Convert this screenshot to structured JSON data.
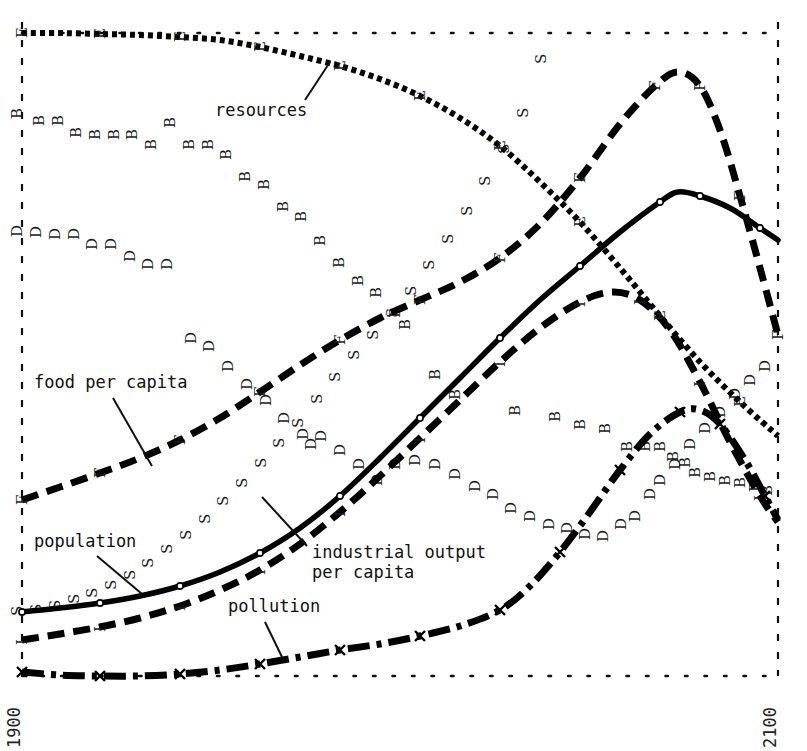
{
  "figure": {
    "background": "#ffffff",
    "ink": "#000000",
    "x_axis": {
      "left_tick_label": "1900",
      "right_tick_label": "2100",
      "orientation": "vertical-rotated"
    },
    "annotations": [
      {
        "name": "resources",
        "text": "resources",
        "x": 215,
        "y": 116,
        "leader": [
          [
            305,
            100
          ],
          [
            330,
            62
          ]
        ]
      },
      {
        "name": "food-per-capita",
        "text": "food per capita",
        "x": 34,
        "y": 388,
        "leader": [
          [
            113,
            398
          ],
          [
            152,
            466
          ]
        ]
      },
      {
        "name": "population",
        "text": "population",
        "x": 34,
        "y": 547,
        "leader": [
          [
            97,
            556
          ],
          [
            142,
            594
          ]
        ]
      },
      {
        "name": "industrial-output-per-capita",
        "text_line1": "industrial output",
        "text_line2": "per capita",
        "x": 312,
        "y": 556,
        "leader": [
          [
            307,
            546
          ],
          [
            262,
            497
          ]
        ]
      },
      {
        "name": "pollution",
        "text": "pollution",
        "x": 228,
        "y": 612,
        "leader": [
          [
            265,
            622
          ],
          [
            282,
            655
          ]
        ]
      }
    ]
  },
  "chart_data": {
    "type": "line",
    "title": "",
    "subtitle": "",
    "xlabel": "",
    "ylabel": "",
    "xlim": [
      1900,
      2100
    ],
    "grid": false,
    "legend": "inline-annotations",
    "xticks": [
      1900,
      2100
    ],
    "xticklabels": [
      "1900",
      "2100"
    ],
    "series": [
      {
        "name": "resources",
        "marker": "E",
        "style": "dotted",
        "points_px": [
          [
            22,
            33
          ],
          [
            60,
            33
          ],
          [
            100,
            34
          ],
          [
            140,
            35
          ],
          [
            180,
            37
          ],
          [
            220,
            40
          ],
          [
            260,
            47
          ],
          [
            300,
            56
          ],
          [
            340,
            66
          ],
          [
            380,
            79
          ],
          [
            420,
            96
          ],
          [
            460,
            118
          ],
          [
            500,
            146
          ],
          [
            540,
            182
          ],
          [
            580,
            222
          ],
          [
            620,
            268
          ],
          [
            660,
            316
          ],
          [
            700,
            362
          ],
          [
            740,
            402
          ],
          [
            778,
            436
          ]
        ],
        "x_years": [
          1900,
          1910,
          1920,
          1930,
          1940,
          1950,
          1960,
          1970,
          1980,
          1990,
          2000,
          2010,
          2020,
          2030,
          2040,
          2050,
          2060,
          2070,
          2080,
          2100
        ],
        "values_rel": [
          1.0,
          1.0,
          0.99,
          0.99,
          0.98,
          0.97,
          0.95,
          0.93,
          0.9,
          0.88,
          0.85,
          0.81,
          0.76,
          0.7,
          0.64,
          0.57,
          0.49,
          0.42,
          0.35,
          0.3
        ]
      },
      {
        "name": "food per capita",
        "marker": "F",
        "style": "dashed",
        "points_px": [
          [
            22,
            500
          ],
          [
            60,
            487
          ],
          [
            100,
            473
          ],
          [
            140,
            458
          ],
          [
            180,
            440
          ],
          [
            220,
            418
          ],
          [
            260,
            392
          ],
          [
            300,
            365
          ],
          [
            340,
            340
          ],
          [
            380,
            318
          ],
          [
            420,
            300
          ],
          [
            460,
            282
          ],
          [
            500,
            258
          ],
          [
            540,
            224
          ],
          [
            580,
            178
          ],
          [
            620,
            124
          ],
          [
            655,
            86
          ],
          [
            678,
            72
          ],
          [
            700,
            86
          ],
          [
            720,
            130
          ],
          [
            740,
            196
          ],
          [
            760,
            268
          ],
          [
            778,
            335
          ]
        ],
        "x_years": [
          1900,
          1910,
          1920,
          1930,
          1940,
          1950,
          1960,
          1970,
          1980,
          1990,
          2000,
          2010,
          2020,
          2030,
          2040,
          2050,
          2058,
          2064,
          2070,
          2076,
          2082,
          2090,
          2100
        ],
        "values_rel": [
          0.25,
          0.28,
          0.31,
          0.34,
          0.38,
          0.42,
          0.47,
          0.52,
          0.57,
          0.61,
          0.64,
          0.68,
          0.73,
          0.79,
          0.88,
          0.97,
          1.0,
          1.0,
          0.97,
          0.88,
          0.75,
          0.6,
          0.47
        ]
      },
      {
        "name": "population",
        "marker": "o",
        "style": "solid",
        "points_px": [
          [
            22,
            612
          ],
          [
            60,
            608
          ],
          [
            100,
            603
          ],
          [
            140,
            596
          ],
          [
            180,
            586
          ],
          [
            220,
            572
          ],
          [
            260,
            553
          ],
          [
            300,
            528
          ],
          [
            340,
            496
          ],
          [
            380,
            458
          ],
          [
            420,
            418
          ],
          [
            460,
            378
          ],
          [
            500,
            338
          ],
          [
            540,
            300
          ],
          [
            580,
            266
          ],
          [
            620,
            232
          ],
          [
            660,
            202
          ],
          [
            678,
            192
          ],
          [
            700,
            196
          ],
          [
            730,
            208
          ],
          [
            760,
            228
          ],
          [
            778,
            240
          ]
        ],
        "x_years": [
          1900,
          1910,
          1920,
          1930,
          1940,
          1950,
          1960,
          1970,
          1980,
          1990,
          2000,
          2010,
          2020,
          2030,
          2040,
          2050,
          2060,
          2066,
          2070,
          2080,
          2092,
          2100
        ],
        "values_rel": [
          0.05,
          0.06,
          0.07,
          0.08,
          0.1,
          0.12,
          0.15,
          0.19,
          0.24,
          0.3,
          0.36,
          0.42,
          0.48,
          0.54,
          0.6,
          0.66,
          0.71,
          0.72,
          0.72,
          0.7,
          0.67,
          0.66
        ]
      },
      {
        "name": "industrial output per capita",
        "marker": "I",
        "style": "dashed",
        "points_px": [
          [
            22,
            640
          ],
          [
            60,
            634
          ],
          [
            100,
            627
          ],
          [
            140,
            618
          ],
          [
            180,
            606
          ],
          [
            220,
            590
          ],
          [
            260,
            570
          ],
          [
            300,
            544
          ],
          [
            340,
            512
          ],
          [
            380,
            476
          ],
          [
            420,
            438
          ],
          [
            460,
            400
          ],
          [
            500,
            362
          ],
          [
            540,
            328
          ],
          [
            580,
            302
          ],
          [
            612,
            292
          ],
          [
            640,
            300
          ],
          [
            670,
            330
          ],
          [
            700,
            382
          ],
          [
            730,
            442
          ],
          [
            760,
            496
          ],
          [
            778,
            522
          ]
        ],
        "x_years": [
          1900,
          1910,
          1920,
          1930,
          1940,
          1950,
          1960,
          1970,
          1980,
          1990,
          2000,
          2010,
          2020,
          2030,
          2040,
          2050,
          2056,
          2062,
          2070,
          2080,
          2092,
          2100
        ],
        "values_rel": [
          0.02,
          0.03,
          0.04,
          0.05,
          0.07,
          0.09,
          0.12,
          0.16,
          0.21,
          0.27,
          0.33,
          0.39,
          0.45,
          0.5,
          0.54,
          0.56,
          0.55,
          0.5,
          0.41,
          0.31,
          0.22,
          0.18
        ]
      },
      {
        "name": "pollution",
        "marker": "x",
        "style": "dash-dot",
        "points_px": [
          [
            22,
            672
          ],
          [
            60,
            675
          ],
          [
            100,
            676
          ],
          [
            140,
            676
          ],
          [
            180,
            674
          ],
          [
            220,
            670
          ],
          [
            260,
            664
          ],
          [
            300,
            657
          ],
          [
            340,
            650
          ],
          [
            380,
            644
          ],
          [
            420,
            636
          ],
          [
            460,
            626
          ],
          [
            500,
            610
          ],
          [
            530,
            586
          ],
          [
            560,
            552
          ],
          [
            590,
            512
          ],
          [
            620,
            470
          ],
          [
            650,
            434
          ],
          [
            680,
            412
          ],
          [
            700,
            410
          ],
          [
            720,
            424
          ],
          [
            745,
            460
          ],
          [
            765,
            496
          ],
          [
            778,
            520
          ]
        ],
        "x_years": [
          1900,
          1910,
          1920,
          1930,
          1940,
          1950,
          1960,
          1970,
          1980,
          1990,
          2000,
          2010,
          2020,
          2028,
          2036,
          2044,
          2052,
          2060,
          2068,
          2074,
          2080,
          2088,
          2095,
          2100
        ],
        "values_rel": [
          0.0,
          0.0,
          0.0,
          0.0,
          0.0,
          0.01,
          0.01,
          0.02,
          0.03,
          0.04,
          0.05,
          0.07,
          0.1,
          0.14,
          0.2,
          0.27,
          0.34,
          0.41,
          0.45,
          0.46,
          0.44,
          0.38,
          0.31,
          0.27
        ]
      }
    ],
    "scatter_markers": [
      {
        "name": "crude birth rate",
        "letter": "B",
        "points_px": [
          [
            22,
            119
          ],
          [
            44,
            126
          ],
          [
            63,
            126
          ],
          [
            81,
            138
          ],
          [
            100,
            140
          ],
          [
            119,
            140
          ],
          [
            137,
            140
          ],
          [
            156,
            150
          ],
          [
            175,
            128
          ],
          [
            194,
            150
          ],
          [
            213,
            150
          ],
          [
            231,
            160
          ],
          [
            250,
            182
          ],
          [
            269,
            190
          ],
          [
            288,
            212
          ],
          [
            306,
            222
          ],
          [
            325,
            246
          ],
          [
            344,
            268
          ],
          [
            363,
            286
          ],
          [
            381,
            298
          ],
          [
            400,
            318
          ],
          [
            410,
            330
          ],
          [
            440,
            380
          ],
          [
            460,
            400
          ],
          [
            520,
            416
          ],
          [
            560,
            422
          ],
          [
            585,
            430
          ],
          [
            610,
            434
          ],
          [
            632,
            452
          ],
          [
            650,
            452
          ],
          [
            665,
            452
          ],
          [
            678,
            462
          ],
          [
            690,
            468
          ],
          [
            700,
            478
          ],
          [
            715,
            482
          ],
          [
            730,
            486
          ],
          [
            745,
            488
          ],
          [
            760,
            492
          ],
          [
            772,
            496
          ]
        ]
      },
      {
        "name": "crude death rate",
        "letter": "D",
        "points_px": [
          [
            22,
            237
          ],
          [
            41,
            238
          ],
          [
            60,
            240
          ],
          [
            79,
            240
          ],
          [
            97,
            250
          ],
          [
            116,
            250
          ],
          [
            135,
            262
          ],
          [
            153,
            270
          ],
          [
            172,
            270
          ],
          [
            196,
            344
          ],
          [
            214,
            352
          ],
          [
            233,
            372
          ],
          [
            252,
            390
          ],
          [
            271,
            406
          ],
          [
            289,
            424
          ],
          [
            308,
            440
          ],
          [
            316,
            450
          ],
          [
            326,
            442
          ],
          [
            345,
            456
          ],
          [
            364,
            470
          ],
          [
            382,
            486
          ],
          [
            400,
            470
          ],
          [
            420,
            466
          ],
          [
            440,
            470
          ],
          [
            460,
            480
          ],
          [
            480,
            492
          ],
          [
            498,
            500
          ],
          [
            516,
            514
          ],
          [
            535,
            522
          ],
          [
            554,
            530
          ],
          [
            572,
            534
          ],
          [
            590,
            540
          ],
          [
            608,
            542
          ],
          [
            626,
            530
          ],
          [
            640,
            522
          ],
          [
            655,
            500
          ],
          [
            665,
            486
          ],
          [
            680,
            470
          ],
          [
            695,
            450
          ],
          [
            710,
            434
          ],
          [
            725,
            418
          ],
          [
            740,
            400
          ],
          [
            755,
            386
          ],
          [
            770,
            372
          ]
        ]
      },
      {
        "name": "services per capita",
        "letter": "S",
        "points_px": [
          [
            22,
            616
          ],
          [
            41,
            614
          ],
          [
            60,
            610
          ],
          [
            79,
            604
          ],
          [
            97,
            598
          ],
          [
            116,
            590
          ],
          [
            135,
            580
          ],
          [
            153,
            568
          ],
          [
            172,
            554
          ],
          [
            191,
            540
          ],
          [
            210,
            524
          ],
          [
            228,
            506
          ],
          [
            247,
            488
          ],
          [
            266,
            468
          ],
          [
            284,
            448
          ],
          [
            303,
            428
          ],
          [
            322,
            404
          ],
          [
            340,
            382
          ],
          [
            359,
            360
          ],
          [
            378,
            340
          ],
          [
            397,
            318
          ],
          [
            416,
            296
          ],
          [
            434,
            270
          ],
          [
            453,
            244
          ],
          [
            472,
            216
          ],
          [
            490,
            186
          ],
          [
            509,
            154
          ],
          [
            528,
            118
          ],
          [
            546,
            64
          ]
        ]
      }
    ]
  }
}
